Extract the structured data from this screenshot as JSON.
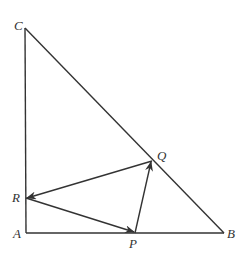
{
  "diagram": {
    "points": {
      "A": {
        "label": "A",
        "x": 26,
        "y": 233
      },
      "B": {
        "label": "B",
        "x": 224,
        "y": 233
      },
      "C": {
        "label": "C",
        "x": 25,
        "y": 28
      },
      "P": {
        "label": "P",
        "x": 135,
        "y": 233
      },
      "Q": {
        "label": "Q",
        "x": 152,
        "y": 161
      },
      "R": {
        "label": "R",
        "x": 26,
        "y": 198
      }
    },
    "segments": [
      "AB",
      "AC",
      "BC"
    ],
    "vectors": [
      "R→P",
      "P→Q",
      "Q→R"
    ],
    "colors": {
      "stroke": "#333333",
      "background": "#ffffff"
    }
  }
}
